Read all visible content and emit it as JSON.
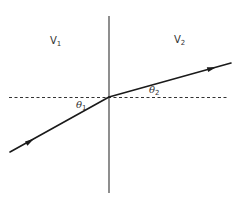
{
  "diagram": {
    "regions": [
      {
        "id": "medium-1",
        "label_base": "V",
        "label_sub": "1"
      },
      {
        "id": "medium-2",
        "label_base": "V",
        "label_sub": "2"
      }
    ],
    "angles": [
      {
        "id": "theta-1",
        "label_base": "θ",
        "label_sub": "1"
      },
      {
        "id": "theta-2",
        "label_base": "θ",
        "label_sub": "2"
      }
    ],
    "geometry": {
      "boundary": {
        "x1": 109,
        "y1": 16,
        "x2": 109,
        "y2": 193
      },
      "normal_dashed": {
        "x1": 9,
        "y1": 97,
        "x2": 227,
        "y2": 97
      },
      "incident_ray": {
        "x1": 10,
        "y1": 152,
        "x2": 109,
        "y2": 97
      },
      "refracted_ray": {
        "x1": 109,
        "y1": 97,
        "x2": 231,
        "y2": 63
      }
    },
    "colors": {
      "line": "#1a1a1a",
      "boundary": "#444444",
      "dashed": "#333333",
      "text": "#333333"
    }
  }
}
